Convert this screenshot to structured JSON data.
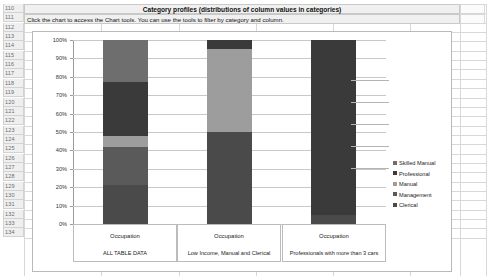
{
  "spreadsheet": {
    "row_headers": [
      "110",
      "111",
      "112",
      "113",
      "114",
      "115",
      "116",
      "117",
      "118",
      "119",
      "120",
      "121",
      "122",
      "123",
      "124",
      "125",
      "126",
      "127",
      "128",
      "129",
      "130",
      "131",
      "132",
      "133",
      "134"
    ],
    "title": "Category profiles (distributions of column values in categories)",
    "instruction": "Click the chart to access the Chart tools. You can use the tools to filter by category and column."
  },
  "legend": {
    "title": "",
    "items": [
      {
        "label": "Skilled Manual",
        "color": "#6e6e6e"
      },
      {
        "label": "Professional",
        "color": "#3a3a3a"
      },
      {
        "label": "Manual",
        "color": "#9d9d9d"
      },
      {
        "label": "Management",
        "color": "#5a5a5a"
      },
      {
        "label": "Clerical",
        "color": "#4a4a4a"
      }
    ]
  },
  "chart_data": {
    "type": "bar",
    "subtype": "100% stacked column",
    "title": "",
    "xlabel": "",
    "ylabel": "",
    "ylim": [
      0,
      100
    ],
    "grid": true,
    "legend_position": "right",
    "ytick_labels": [
      "100%",
      "90%",
      "80%",
      "70%",
      "60%",
      "50%",
      "40%",
      "30%",
      "20%",
      "10%",
      "0%"
    ],
    "ytick_values": [
      100,
      90,
      80,
      70,
      60,
      50,
      40,
      30,
      20,
      10,
      0
    ],
    "categories": [
      {
        "name": "Occupation",
        "sublabel": "ALL TABLE DATA"
      },
      {
        "name": "Occupation",
        "sublabel": "Low Income, Manual and Clerical"
      },
      {
        "name": "Occupation",
        "sublabel": "Professionals with  more than 3 cars"
      }
    ],
    "series": [
      {
        "name": "Skilled Manual",
        "color": "#6e6e6e",
        "values": [
          23,
          0,
          0
        ]
      },
      {
        "name": "Professional",
        "color": "#3a3a3a",
        "values": [
          29,
          5,
          95
        ]
      },
      {
        "name": "Manual",
        "color": "#9d9d9d",
        "values": [
          6,
          45,
          0
        ]
      },
      {
        "name": "Management",
        "color": "#5a5a5a",
        "values": [
          21,
          0,
          0
        ]
      },
      {
        "name": "Clerical",
        "color": "#4a4a4a",
        "values": [
          21,
          50,
          5
        ]
      }
    ]
  }
}
